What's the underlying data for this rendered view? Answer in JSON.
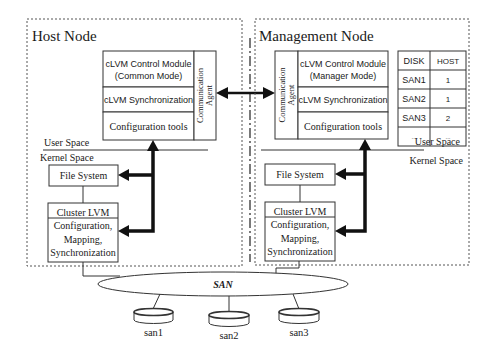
{
  "host_node": {
    "title": "Host Node",
    "modules": {
      "control_line1": "cLVM Control Module",
      "control_line2": "(Common Mode)",
      "sync": "cLVM Synchronization",
      "config": "Configuration tools",
      "agent_line1": "Communication",
      "agent_line2": "Agent"
    },
    "user_space": "User Space",
    "kernel_space": "Kernel Space",
    "file_system": "File System",
    "cluster_lvm": {
      "title": "Cluster LVM",
      "line1": "Configuration,",
      "line2": "Mapping,",
      "line3": "Synchronization"
    }
  },
  "management_node": {
    "title": "Management Node",
    "modules": {
      "control_line1": "cLVM Control Module",
      "control_line2": "(Manager Mode)",
      "sync": "cLVM Synchronization",
      "config": "Configuration tools",
      "agent_line1": "Communication",
      "agent_line2": "Agent"
    },
    "table": {
      "headers": [
        "DISK",
        "HOST"
      ],
      "rows": [
        [
          "SAN1",
          "1"
        ],
        [
          "SAN2",
          "1"
        ],
        [
          "SAN3",
          "2"
        ],
        [
          "...",
          "..."
        ]
      ]
    },
    "user_space": "User Space",
    "kernel_space": "Kernel Space",
    "file_system": "File System",
    "cluster_lvm": {
      "title": "Cluster LVM",
      "line1": "Configuration,",
      "line2": "Mapping,",
      "line3": "Synchronization"
    }
  },
  "san": {
    "label": "SAN",
    "disks": [
      "san1",
      "san2",
      "san3"
    ]
  }
}
